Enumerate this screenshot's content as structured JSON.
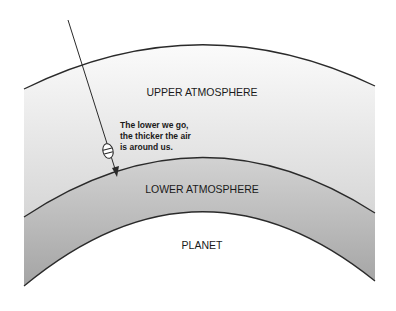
{
  "diagram": {
    "layers": {
      "upper": "UPPER ATMOSPHERE",
      "lower": "LOWER ATMOSPHERE",
      "planet": "PLANET"
    },
    "caption_lines": [
      "The lower we go,",
      "the thicker the air",
      "is around us."
    ],
    "icons": {
      "probe": "capsule-probe-icon",
      "arrow": "descent-arrow-icon"
    },
    "colors": {
      "stroke": "#2a2a2a",
      "upper_fill_top": "#fafafa",
      "upper_fill_bottom": "#d8d8d8",
      "lower_fill_top": "#d0d0d0",
      "lower_fill_bottom": "#a8a8a8",
      "planet_fill": "#ffffff"
    }
  }
}
